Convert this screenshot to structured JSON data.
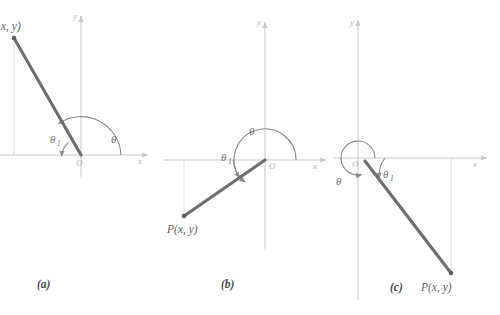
{
  "figure": {
    "type": "geometry-diagram",
    "background_color": "#ffffff",
    "panels": [
      {
        "id": "a",
        "caption": "(a)",
        "caption_pos": [
          44,
          286
        ],
        "origin_label": "O",
        "origin_pos": [
          81,
          155
        ],
        "axis_x_label": "x",
        "axis_y_label": "y",
        "point_label": "x, y)",
        "point_label_note": "P( is cropped off the left edge of the screenshot",
        "point_label_pos": [
          2,
          30
        ],
        "point_pos": [
          14,
          38
        ],
        "angle_theta_label": "θ",
        "angle_theta_pos": [
          113,
          139
        ],
        "angle_theta1_label": "θ",
        "angle_theta1_sub": "1",
        "angle_theta1_pos": [
          54,
          139
        ],
        "segment": {
          "x1": 14,
          "y1": 38,
          "x2": 81,
          "y2": 155
        },
        "dropline": {
          "x": 14,
          "y_top": 155,
          "y_bottom": 38
        }
      },
      {
        "id": "b",
        "caption": "(b)",
        "caption_pos": [
          228,
          286
        ],
        "origin_label": "O",
        "origin_pos": [
          268,
          166
        ],
        "axis_x_label": "x",
        "axis_y_label": "y",
        "point_label": "P(x, y)",
        "point_label_pos": [
          170,
          231
        ],
        "point_pos": [
          184,
          216
        ],
        "angle_theta_label": "θ",
        "angle_theta_pos": [
          252,
          131
        ],
        "angle_theta1_label": "θ",
        "angle_theta1_sub": "1",
        "angle_theta1_pos": [
          226,
          158
        ],
        "segment": {
          "x1": 184,
          "y1": 216,
          "x2": 265,
          "y2": 160
        },
        "dropline": {
          "x": 184,
          "y_top": 160,
          "y_bottom": 216
        }
      },
      {
        "id": "c",
        "caption": "(c)",
        "caption_pos": [
          394,
          289
        ],
        "origin_label": "O",
        "origin_pos": [
          356,
          163
        ],
        "axis_x_label": "x",
        "axis_y_label": "y",
        "point_label": "P(x, y)",
        "point_label_pos": [
          424,
          289
        ],
        "point_pos": [
          451,
          273
        ],
        "angle_theta_label": "θ",
        "angle_theta_pos": [
          339,
          181
        ],
        "angle_theta1_label": "θ",
        "angle_theta1_sub": "1",
        "angle_theta1_pos": [
          387,
          174
        ],
        "segment": {
          "x1": 365,
          "y1": 161,
          "x2": 451,
          "y2": 273
        },
        "dropline": {
          "x": 451,
          "y_top": 158,
          "y_bottom": 273
        }
      }
    ],
    "colors": {
      "segment": "#6e6e6e",
      "axis": "#c9c9c9",
      "arc": "#8a8a8a",
      "dropline": "#dcdcdc",
      "text": "#6b6b6b",
      "caption": "#4a4a4a"
    },
    "axes": {
      "a": {
        "origin": [
          81,
          155
        ],
        "x_min": 0,
        "x_max": 152,
        "y_top": 14,
        "y_bottom": 178,
        "x_label_pos": [
          140,
          163
        ],
        "y_label_pos": [
          74,
          16
        ]
      },
      "b": {
        "origin": [
          265,
          160
        ],
        "x_min": 163,
        "x_max": 330,
        "y_top": 20,
        "y_bottom": 250,
        "x_label_pos": [
          315,
          168
        ],
        "y_label_pos": [
          258,
          22
        ]
      },
      "c": {
        "origin": [
          358,
          158
        ],
        "x_min": 333,
        "x_max": 490,
        "y_top": 18,
        "y_bottom": 300,
        "x_label_pos": [
          475,
          166
        ],
        "y_label_pos": [
          351,
          22
        ]
      }
    }
  }
}
